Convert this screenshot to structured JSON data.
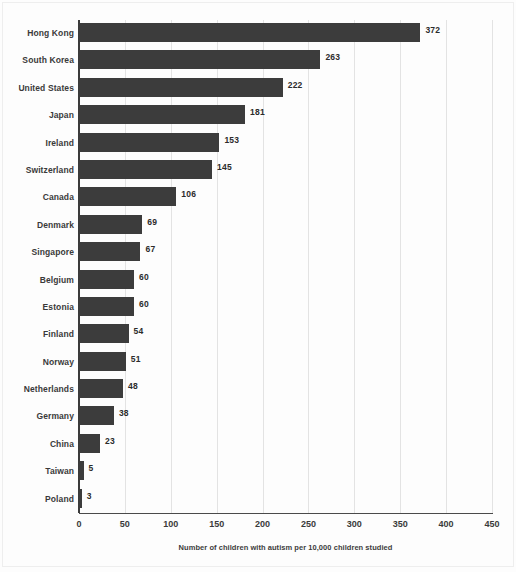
{
  "chart_data": {
    "type": "bar",
    "orientation": "horizontal",
    "title": "",
    "xlabel": "Number of children with autism per 10,000 children studied",
    "ylabel": "",
    "xlim": [
      0,
      450
    ],
    "xticks": [
      0,
      50,
      100,
      150,
      200,
      250,
      300,
      350,
      400,
      450
    ],
    "grid": "vertical",
    "legend": "none",
    "bar_color": "#3c3c3c",
    "value_labels": true,
    "categories": [
      "Hong Kong",
      "South Korea",
      "United States",
      "Japan",
      "Ireland",
      "Switzerland",
      "Canada",
      "Denmark",
      "Singapore",
      "Belgium",
      "Estonia",
      "Finland",
      "Norway",
      "Netherlands",
      "Germany",
      "China",
      "Taiwan",
      "Poland"
    ],
    "values": [
      372,
      263,
      222,
      181,
      153,
      145,
      106,
      69,
      67,
      60,
      60,
      54,
      51,
      48,
      38,
      23,
      5,
      3
    ],
    "value_labels_text": [
      "372",
      "263",
      "222",
      "181",
      "153",
      "145",
      "106",
      "69",
      "67",
      "60",
      "60",
      "54",
      "51",
      "48",
      "38",
      "23",
      "5",
      "3"
    ],
    "xtick_labels": [
      "0",
      "50",
      "100",
      "150",
      "200",
      "250",
      "300",
      "350",
      "400",
      "450"
    ]
  }
}
